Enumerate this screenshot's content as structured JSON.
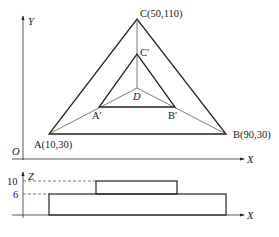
{
  "top_view": {
    "y_axis_label": "Y",
    "x_axis_label": "X",
    "origin_label": "O",
    "points": {
      "A": {
        "label": "A(10,30)",
        "x": 10,
        "y": 30
      },
      "B": {
        "label": "B(90,30)",
        "x": 90,
        "y": 30
      },
      "C": {
        "label": "C(50,110)",
        "x": 50,
        "y": 110
      },
      "A_prime": {
        "label": "A′"
      },
      "B_prime": {
        "label": "B′"
      },
      "C_prime": {
        "label": "C′"
      },
      "D": {
        "label": "D"
      }
    }
  },
  "side_view": {
    "z_axis_label": "Z",
    "x_axis_label": "X",
    "z_ticks": [
      "10",
      "6"
    ]
  }
}
